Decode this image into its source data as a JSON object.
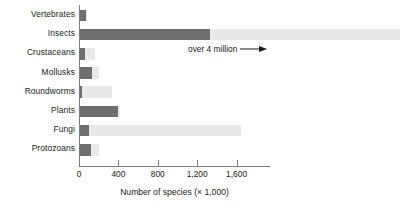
{
  "chart_data": {
    "type": "bar",
    "orientation": "horizontal",
    "title": "",
    "xlabel": "Number of species (× 1,000)",
    "ylabel": "",
    "xlim": [
      0,
      1940
    ],
    "xticks": [
      0,
      400,
      800,
      1200,
      1600
    ],
    "xtick_labels": [
      "0",
      "400",
      "800",
      "1,200",
      "1,600"
    ],
    "grid": false,
    "legend": "none",
    "categories": [
      "Vertebrates",
      "Insects",
      "Crustaceans",
      "Mollusks",
      "Roundworms",
      "Plants",
      "Fungi",
      "Protozoans"
    ],
    "series": [
      {
        "name": "Known species (x 1,000)",
        "color": "#6e6e6e",
        "values": [
          70,
          1330,
          60,
          130,
          30,
          400,
          100,
          120
        ]
      },
      {
        "name": "Estimated total species (x 1,000)",
        "color": "#e9e9e9",
        "values": [
          80,
          3260,
          160,
          200,
          330,
          420,
          1640,
          200
        ]
      }
    ],
    "annotations": [
      {
        "text": "over 4 million",
        "target_category": "Insects",
        "arrow": "right"
      }
    ]
  }
}
